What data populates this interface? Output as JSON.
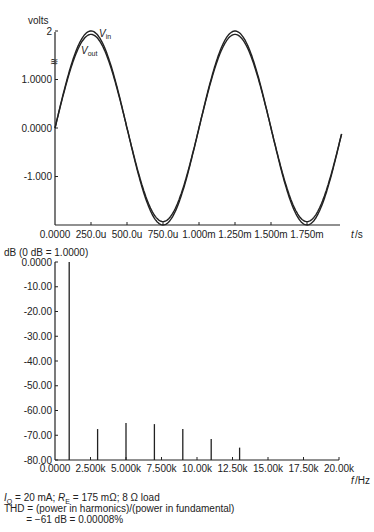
{
  "chart_data": [
    {
      "type": "line",
      "title": "",
      "ylabel": "volts",
      "xlabel": "t/s",
      "ylim": [
        -2,
        2
      ],
      "xlim": [
        0,
        0.00195
      ],
      "y_ticks": [
        "2",
        "1.0000",
        "0.0000",
        "-1.000"
      ],
      "y_tick_values": [
        2,
        1,
        0,
        -1
      ],
      "x_ticks": [
        "0.0000",
        "250.0u",
        "500.0u",
        "750.0u",
        "1.000m",
        "1.250m",
        "1.500m",
        "1.750m"
      ],
      "x_tick_values": [
        0,
        0.00025,
        0.0005,
        0.00075,
        0.001,
        0.00125,
        0.0015,
        0.00175
      ],
      "series": [
        {
          "name": "V_in",
          "amplitude": 2.0,
          "frequency_hz": 1000
        },
        {
          "name": "V_out",
          "amplitude": 1.93,
          "frequency_hz": 1000
        }
      ],
      "annotations": [
        "Vin",
        "Vout"
      ],
      "grid": false
    },
    {
      "type": "bar",
      "title": "",
      "ylabel": "dB (0 dB = 1.0000)",
      "xlabel": "f/Hz",
      "ylim": [
        -80,
        0
      ],
      "xlim": [
        0,
        20000
      ],
      "y_ticks": [
        "0.0000",
        "-10.00",
        "-20.00",
        "-30.00",
        "-40.00",
        "-50.00",
        "-60.00",
        "-70.00",
        "-80.00"
      ],
      "x_ticks": [
        "0.0000",
        "2.500k",
        "5.000k",
        "7.500k",
        "10.00k",
        "12.50k",
        "15.00k",
        "17.50k",
        "20.00k"
      ],
      "x": [
        1000,
        3000,
        5000,
        7000,
        9000,
        11000,
        13000
      ],
      "values": [
        0,
        -67.5,
        -65,
        -65.5,
        -67.5,
        -71.5,
        -75
      ],
      "grid": false
    }
  ],
  "top_chart": {
    "ylabel": "volts",
    "xlabel": "t/s",
    "vin_label": "V",
    "vin_sub": "in",
    "vout_label": "V",
    "vout_sub": "out"
  },
  "bottom_chart": {
    "ylabel": "dB (0 dB = 1.0000)",
    "xlabel": "f/Hz"
  },
  "notes": {
    "line1_iq": "I",
    "line1_iq_sub": "Q",
    "line1_a": " = 20 mA; ",
    "line1_re": "R",
    "line1_re_sub": "E",
    "line1_b": " = 175 mΩ; 8 Ω load",
    "line2": "THD = (power in harmonics)/(power in fundamental)",
    "line3": "        = −61 dB = 0.00008%"
  }
}
